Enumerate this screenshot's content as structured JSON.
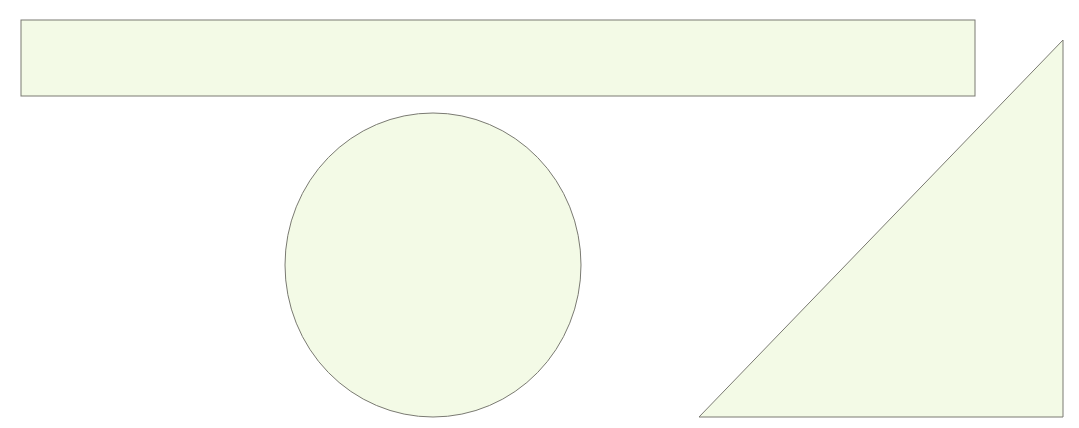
{
  "canvas": {
    "width": 1079,
    "height": 428,
    "background": "#ffffff"
  },
  "style": {
    "fill": "#f3fae6",
    "stroke": "#7a7a72",
    "stroke_width": 1
  },
  "shapes": [
    {
      "type": "rectangle",
      "name": "rectangle",
      "x": 21,
      "y": 20,
      "width": 954,
      "height": 76
    },
    {
      "type": "ellipse",
      "name": "circle",
      "cx": 433,
      "cy": 265,
      "rx": 148,
      "ry": 152
    },
    {
      "type": "triangle",
      "name": "right-triangle",
      "points": "1063,40 1063,417 699,417"
    }
  ]
}
